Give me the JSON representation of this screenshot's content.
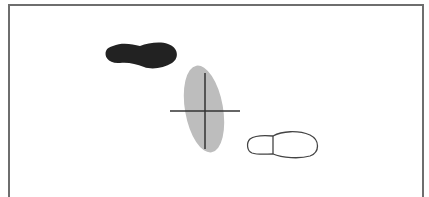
{
  "diagram": {
    "frame": {
      "stroke": "#6e6e6e",
      "fill": "#ffffff"
    },
    "shapes": [
      {
        "id": "filled-footprint",
        "kind": "shoe-print",
        "style": "filled",
        "fill": "#222222",
        "center": [
          143,
          56
        ],
        "orientation": "horizontal"
      },
      {
        "id": "gray-ellipse",
        "kind": "ellipse",
        "fill": "#bdbdbd",
        "center": [
          204,
          109
        ],
        "rx": 19,
        "ry": 44,
        "rotation_deg": -10
      },
      {
        "id": "crosshair",
        "kind": "crosshair",
        "stroke": "#333333",
        "horizontal": {
          "x1": 170,
          "x2": 240,
          "y": 111
        },
        "vertical": {
          "x": 205,
          "y1": 73,
          "y2": 149
        }
      },
      {
        "id": "outlined-footprint",
        "kind": "shoe-print",
        "style": "outline",
        "stroke": "#444444",
        "center": [
          283,
          145
        ],
        "orientation": "horizontal"
      }
    ]
  }
}
